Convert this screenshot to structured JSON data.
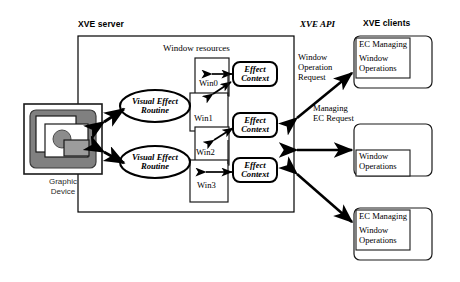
{
  "diagram": {
    "regions": {
      "server_label": "XVE server",
      "api_label": "XVE API",
      "clients_label": "XVE clients",
      "window_resources_label": "Window resources"
    },
    "graphic_device": {
      "label_line1": "Graphic",
      "label_line2": "Device"
    },
    "windows": [
      {
        "id": "win0",
        "label": "Win0"
      },
      {
        "id": "win1",
        "label": "Win1"
      },
      {
        "id": "win2",
        "label": "Win2"
      },
      {
        "id": "win3",
        "label": "Win3"
      }
    ],
    "routines": [
      {
        "id": "ver-top",
        "line1": "Visual Effect",
        "line2": "Routine"
      },
      {
        "id": "ver-bottom",
        "line1": "Visual Effect",
        "line2": "Routine"
      }
    ],
    "effect_contexts": [
      {
        "id": "ec-0",
        "line1": "Effect",
        "line2": "Context"
      },
      {
        "id": "ec-1",
        "line1": "Effect",
        "line2": "Context"
      },
      {
        "id": "ec-2",
        "line1": "Effect",
        "line2": "Context"
      }
    ],
    "api_messages": [
      {
        "id": "window-operation-request",
        "line1": "Window",
        "line2": "Operation",
        "line3": "Request"
      },
      {
        "id": "managing-ec-request",
        "line1": "Managing",
        "line2": "EC Request"
      }
    ],
    "clients": [
      {
        "id": "client-top",
        "inner_line1": "EC Managing",
        "inner_line2": "Window",
        "inner_line3": "Operations"
      },
      {
        "id": "client-middle",
        "inner_line1": "",
        "inner_line2": "Window",
        "inner_line3": "Operations"
      },
      {
        "id": "client-bottom",
        "inner_line1": "EC Managing",
        "inner_line2": "Window",
        "inner_line3": "Operations"
      }
    ],
    "colors": {
      "stroke": "#000000",
      "background": "#ffffff",
      "device_frame_fill": "#e8e8e8",
      "device_inner_fill": "#808080",
      "device_window_fill": "#ffffff",
      "device_shape_fill": "#8c8c8c",
      "text": "#000000",
      "device_caption": "#2b2b2b"
    }
  }
}
